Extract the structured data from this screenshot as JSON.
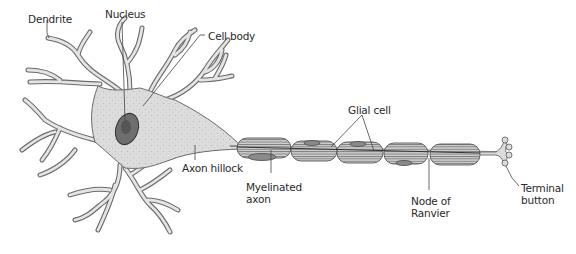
{
  "diagram": {
    "labels": {
      "dendrite": "Dendrite",
      "nucleus": "Nucleus",
      "cell_body": "Cell body",
      "glial_cell": "Glial cell",
      "axon_hillock": "Axon hillock",
      "myelinated_axon_1": "Myelinated",
      "myelinated_axon_2": "axon",
      "node_of_ranvier_1": "Node of",
      "node_of_ranvier_2": "Ranvier",
      "terminal_button_1": "Terminal",
      "terminal_button_2": "button"
    },
    "colors": {
      "cell_fill": "#dedede",
      "cell_outline": "#6a6a6a",
      "nucleus_fill": "#6e6e6e",
      "nucleus_inner": "#555555",
      "myelin_fill": "#bdbdbd",
      "myelin_stripe": "#777777",
      "leader_line": "#444444",
      "text": "#2a2a2a"
    }
  }
}
